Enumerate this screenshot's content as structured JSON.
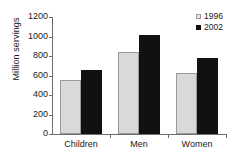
{
  "chart_data": {
    "type": "bar",
    "title": "",
    "xlabel": "",
    "ylabel": "Million servings",
    "categories": [
      "Children",
      "Men",
      "Women"
    ],
    "series": [
      {
        "name": "1996",
        "color": "#d9d9d9",
        "values": [
          554,
          841,
          626
        ]
      },
      {
        "name": "2002",
        "color": "#111111",
        "values": [
          656,
          1015,
          780
        ]
      }
    ],
    "ylim": [
      0,
      1200
    ],
    "yticks": [
      0,
      200,
      400,
      600,
      800,
      1000,
      1200
    ],
    "ytick_labels": [
      "0",
      "200",
      "400",
      "600",
      "800",
      "1000",
      "1200"
    ],
    "grid": false,
    "legend_position": "top-right",
    "legend_entries": [
      {
        "label": "1996",
        "swatch": "light-gray-square"
      },
      {
        "label": "2002",
        "swatch": "black-square"
      }
    ]
  }
}
